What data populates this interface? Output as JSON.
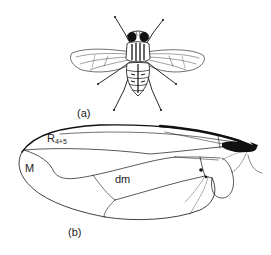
{
  "figure": {
    "panel_a": {
      "label": "(a)",
      "subject": "fly (dorsal view)"
    },
    "panel_b": {
      "label": "(b)",
      "subject": "fly wing venation",
      "vein_labels": {
        "r45_main": "R",
        "r45_sub": "4+5",
        "m": "M",
        "dm": "dm"
      }
    },
    "colors": {
      "ink": "#111111",
      "background": "#ffffff"
    }
  }
}
